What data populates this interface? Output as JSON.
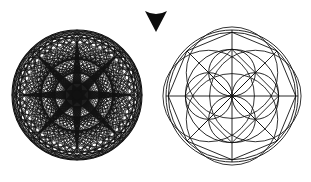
{
  "canvas": {
    "width": 311,
    "height": 182,
    "background": "#ffffff",
    "ink": "#111111",
    "title": "Geometric mandala transformation diagram"
  },
  "figures": [
    {
      "id": "dense-rosette",
      "name": "Dense eight-fold rosette mandala",
      "role": "source",
      "center_x": 77,
      "center_y": 95,
      "radius": 65,
      "stroke": "#111111",
      "description": "Circle densely filled with many rotated ellipses and eight thick radial spokes forming an eight-pointed star",
      "spokes": 8,
      "ellipse_rings": 3,
      "ellipses_per_ring": 24
    },
    {
      "id": "clean-geometry",
      "name": "Sacred geometry quatrefoil mandala",
      "role": "result",
      "center_x": 232,
      "center_y": 96,
      "radius": 66,
      "stroke": "#111111",
      "description": "Outer double circle, inscribed octagon, crossed diagonals, axis lines, inner circle and four-petal quatrefoil",
      "octagon_sides": 8,
      "petals": 4,
      "inner_circle_ratio": 0.707
    }
  ],
  "marker": {
    "id": "down-arrowhead",
    "name": "Downward arrowhead marker",
    "shape": "arrowhead-down",
    "fill": "#0d0d0d",
    "center_x": 156,
    "top_y": 11,
    "tip_y": 32,
    "half_width": 11
  },
  "legend": {
    "source_label": "",
    "result_label": "",
    "caption": ""
  }
}
